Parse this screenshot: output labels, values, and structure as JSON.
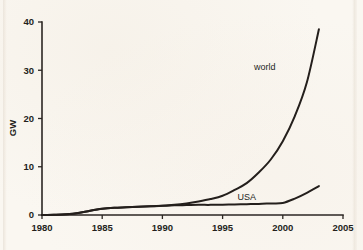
{
  "chart_data": {
    "type": "line",
    "title": "",
    "subtitle": "",
    "xlabel": "",
    "ylabel": "GW",
    "xlim": [
      1980,
      2005
    ],
    "ylim": [
      0,
      40
    ],
    "xticks": [
      1980,
      1985,
      1990,
      1995,
      2000,
      2005
    ],
    "xtick_labels": [
      "1980",
      "1985",
      "1990",
      "1995",
      "2000",
      "2005"
    ],
    "yticks": [
      0,
      10,
      20,
      30,
      40
    ],
    "ytick_labels": [
      "0",
      "10",
      "20",
      "30",
      "40"
    ],
    "grid": false,
    "legend_position": "inline-annotations",
    "x": [
      1980,
      1981,
      1982,
      1983,
      1984,
      1985,
      1986,
      1987,
      1988,
      1989,
      1990,
      1991,
      1992,
      1993,
      1994,
      1995,
      1996,
      1997,
      1998,
      1999,
      2000,
      2001,
      2002,
      2003
    ],
    "series": [
      {
        "name": "world",
        "label": "world",
        "color": "#241f1c",
        "values": [
          0.0,
          0.05,
          0.15,
          0.4,
          0.9,
          1.3,
          1.5,
          1.6,
          1.7,
          1.8,
          1.9,
          2.1,
          2.4,
          2.8,
          3.3,
          4.0,
          5.2,
          6.6,
          8.8,
          11.5,
          15.3,
          20.5,
          27.5,
          38.5
        ]
      },
      {
        "name": "USA",
        "label": "USA",
        "color": "#241f1c",
        "values": [
          0.0,
          0.05,
          0.15,
          0.4,
          0.9,
          1.3,
          1.5,
          1.6,
          1.7,
          1.8,
          1.9,
          2.0,
          2.05,
          2.1,
          2.1,
          2.15,
          2.2,
          2.25,
          2.3,
          2.4,
          2.5,
          3.4,
          4.6,
          6.0
        ]
      }
    ],
    "annotations": [
      {
        "text": "world",
        "x": 1998.5,
        "y": 30.0
      },
      {
        "text": "USA",
        "x": 1997.0,
        "y": 3.2
      }
    ]
  }
}
